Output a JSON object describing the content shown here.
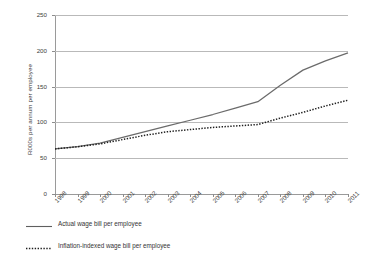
{
  "chart_data": {
    "type": "line",
    "title": "",
    "xlabel": "",
    "ylabel": "R000s per annum per employee",
    "ylim": [
      0,
      250
    ],
    "yticks": [
      0,
      50,
      100,
      150,
      200,
      250
    ],
    "grid": true,
    "legend_position": "bottom-left",
    "categories": [
      "1998",
      "1999",
      "2000",
      "2001",
      "2002",
      "2003",
      "2004",
      "2005",
      "2006",
      "2007",
      "2008",
      "2009",
      "2010",
      "2011"
    ],
    "series": [
      {
        "name": "Actual wage bill per employee",
        "style": "solid",
        "color": "#6b6b6b",
        "values": [
          63,
          66,
          71,
          79,
          87,
          95,
          103,
          111,
          120,
          129,
          152,
          173,
          186,
          197
        ]
      },
      {
        "name": "Inflation-indexed wage bill per employee",
        "style": "dotted",
        "color": "#1f1f1f",
        "values": [
          63,
          66,
          70,
          76,
          82,
          87,
          90,
          93,
          95,
          97,
          106,
          114,
          123,
          131
        ]
      }
    ]
  },
  "axis": {
    "y_title": "R000s per annum per employee",
    "y_tick_labels": [
      "250",
      "200",
      "150",
      "100",
      "50",
      "0"
    ],
    "x_tick_labels": [
      "1998",
      "1999",
      "2000",
      "2001",
      "2002",
      "2003",
      "2004",
      "2005",
      "2006",
      "2007",
      "2008",
      "2009",
      "2010",
      "2011"
    ]
  },
  "legend": {
    "items": [
      {
        "label": "Actual wage bill per employee",
        "style": "solid"
      },
      {
        "label": "Inflation-indexed wage bill per employee",
        "style": "dotted"
      }
    ]
  },
  "colors": {
    "actual_line": "#6b6b6b",
    "indexed_line": "#1f1f1f",
    "gridline": "#b9b9b9",
    "axis": "#9a9a9a",
    "text": "#3d3d3d",
    "background": "#ffffff"
  }
}
